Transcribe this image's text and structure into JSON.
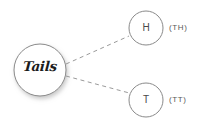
{
  "diagram": {
    "type": "probability-tree",
    "background_color": "#ffffff",
    "root": {
      "label": "Tails",
      "center_x": 40,
      "center_y": 70,
      "radius": 26,
      "stroke_color": "#8a8a8a",
      "text_color": "#1c1c1c",
      "has_shadow": true
    },
    "branches": [
      {
        "id": "branch-heads",
        "style": "dashed",
        "color": "#9a9a9a",
        "from_x": 66,
        "from_y": 64,
        "to_x": 129,
        "to_y": 36
      },
      {
        "id": "branch-tails",
        "style": "dashed",
        "color": "#9a9a9a",
        "from_x": 66,
        "from_y": 76,
        "to_x": 133,
        "to_y": 94
      }
    ],
    "leaves": [
      {
        "id": "leaf-h",
        "label": "H",
        "outcome": "(TH)",
        "center_x": 146,
        "center_y": 28,
        "radius": 17,
        "stroke_color": "#8a8a8a",
        "text_color": "#4a4a4a"
      },
      {
        "id": "leaf-t",
        "label": "T",
        "outcome": "(TT)",
        "center_x": 146,
        "center_y": 100,
        "radius": 17,
        "stroke_color": "#8a8a8a",
        "text_color": "#4a4a4a"
      }
    ]
  }
}
